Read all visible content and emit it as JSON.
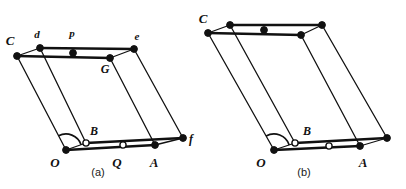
{
  "image": {
    "kind": "geometry-diagram",
    "title": "Two shear-equivalent parallelogram figures",
    "background_color": "#ffffff",
    "stroke_color": "#111111",
    "vertex_fill_color": "#111111",
    "vertex_hollow_fill": "#ffffff"
  },
  "figures": [
    {
      "id": "a",
      "caption": "(a)",
      "caption_x": 98,
      "caption_y": 176,
      "labels": [
        {
          "text": "C",
          "x": 10,
          "y": 45,
          "size": 13
        },
        {
          "text": "d",
          "x": 37,
          "y": 38,
          "size": 11
        },
        {
          "text": "p",
          "x": 72,
          "y": 37,
          "size": 11
        },
        {
          "text": "e",
          "x": 137,
          "y": 40,
          "size": 11
        },
        {
          "text": "G",
          "x": 105,
          "y": 73,
          "size": 12
        },
        {
          "text": "B",
          "x": 94,
          "y": 135,
          "size": 12
        },
        {
          "text": "O",
          "x": 55,
          "y": 167,
          "size": 13
        },
        {
          "text": "Q",
          "x": 117,
          "y": 167,
          "size": 13
        },
        {
          "text": "A",
          "x": 154,
          "y": 167,
          "size": 13
        },
        {
          "text": "f",
          "x": 191,
          "y": 143,
          "size": 12
        }
      ],
      "points": {
        "C": {
          "x": 17,
          "y": 56,
          "style": "filled"
        },
        "d": {
          "x": 40,
          "y": 48,
          "style": "filled"
        },
        "p": {
          "x": 73,
          "y": 53,
          "style": "filled"
        },
        "e": {
          "x": 134,
          "y": 49,
          "style": "filled"
        },
        "G": {
          "x": 110,
          "y": 58,
          "style": "filled"
        },
        "B": {
          "x": 86,
          "y": 143,
          "style": "hollow"
        },
        "O": {
          "x": 66,
          "y": 150,
          "style": "filled"
        },
        "Q": {
          "x": 123,
          "y": 145,
          "style": "hollow"
        },
        "A": {
          "x": 155,
          "y": 145,
          "style": "filled"
        },
        "f": {
          "x": 183,
          "y": 138,
          "style": "filled"
        }
      },
      "edges": [
        {
          "from": "C",
          "to": "d",
          "weight": "thin"
        },
        {
          "from": "d",
          "to": "e",
          "weight": "thick"
        },
        {
          "from": "C",
          "to": "G",
          "weight": "thick"
        },
        {
          "from": "G",
          "to": "e",
          "weight": "thin"
        },
        {
          "from": "C",
          "to": "O",
          "weight": "thin"
        },
        {
          "from": "d",
          "to": "B",
          "weight": "thin"
        },
        {
          "from": "G",
          "to": "A",
          "weight": "thin"
        },
        {
          "from": "e",
          "to": "f",
          "weight": "thin"
        },
        {
          "from": "O",
          "to": "A",
          "weight": "thick"
        },
        {
          "from": "B",
          "to": "f",
          "weight": "thick"
        },
        {
          "from": "O",
          "to": "B",
          "weight": "thin"
        },
        {
          "from": "A",
          "to": "f",
          "weight": "thin"
        }
      ],
      "angle_arc": {
        "at": "O",
        "r": 16,
        "from": "B",
        "to": "C"
      }
    },
    {
      "id": "b",
      "caption": "(b)",
      "caption_x": 304,
      "caption_y": 176,
      "labels": [
        {
          "text": "C",
          "x": 203,
          "y": 23,
          "size": 13
        },
        {
          "text": "B",
          "x": 307,
          "y": 135,
          "size": 12
        },
        {
          "text": "O",
          "x": 261,
          "y": 167,
          "size": 13
        },
        {
          "text": "A",
          "x": 363,
          "y": 167,
          "size": 13
        }
      ],
      "points": {
        "C": {
          "x": 208,
          "y": 33,
          "style": "filled"
        },
        "d": {
          "x": 230,
          "y": 25,
          "style": "filled"
        },
        "p": {
          "x": 264,
          "y": 30,
          "style": "filled"
        },
        "e": {
          "x": 322,
          "y": 25,
          "style": "filled"
        },
        "G": {
          "x": 301,
          "y": 35,
          "style": "filled"
        },
        "B": {
          "x": 295,
          "y": 143,
          "style": "hollow"
        },
        "O": {
          "x": 274,
          "y": 150,
          "style": "filled"
        },
        "Q": {
          "x": 329,
          "y": 146,
          "style": "hollow"
        },
        "A": {
          "x": 360,
          "y": 146,
          "style": "filled"
        },
        "f": {
          "x": 387,
          "y": 138,
          "style": "filled"
        }
      },
      "edges": [
        {
          "from": "C",
          "to": "d",
          "weight": "thin"
        },
        {
          "from": "d",
          "to": "e",
          "weight": "thick"
        },
        {
          "from": "C",
          "to": "G",
          "weight": "thick"
        },
        {
          "from": "G",
          "to": "e",
          "weight": "thin"
        },
        {
          "from": "C",
          "to": "O",
          "weight": "thin"
        },
        {
          "from": "d",
          "to": "B",
          "weight": "thin"
        },
        {
          "from": "G",
          "to": "A",
          "weight": "thin"
        },
        {
          "from": "e",
          "to": "f",
          "weight": "thin"
        },
        {
          "from": "O",
          "to": "A",
          "weight": "thick"
        },
        {
          "from": "B",
          "to": "f",
          "weight": "thick"
        },
        {
          "from": "O",
          "to": "B",
          "weight": "thin"
        },
        {
          "from": "A",
          "to": "f",
          "weight": "thin"
        }
      ],
      "angle_arc": {
        "at": "O",
        "r": 16,
        "from": "B",
        "to": "C"
      }
    }
  ]
}
